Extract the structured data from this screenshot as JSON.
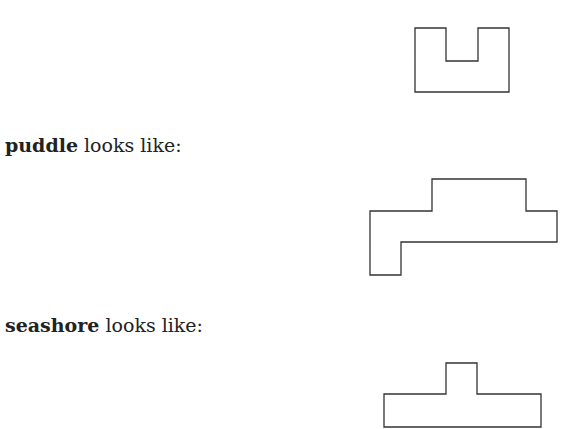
{
  "cutoff_text": "g",
  "items": [
    {
      "word": "",
      "suffix": ""
    },
    {
      "word": "puddle",
      "suffix": " looks like:"
    },
    {
      "word": "seashore",
      "suffix": " looks like:"
    }
  ],
  "stroke_color": "#333333"
}
